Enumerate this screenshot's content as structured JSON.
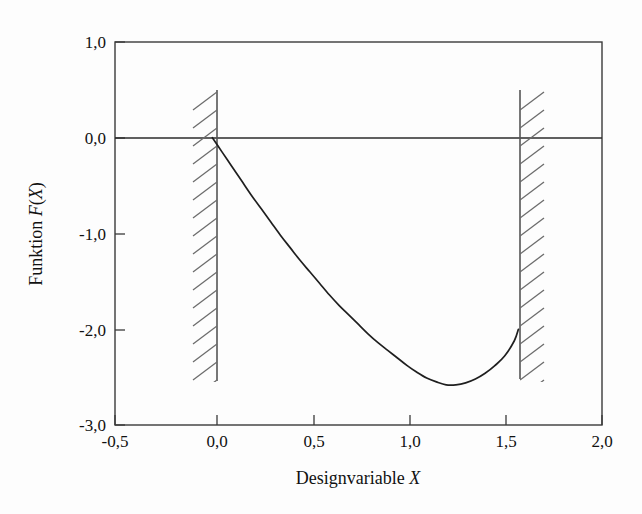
{
  "chart_data": {
    "type": "line",
    "title": "",
    "xlabel": "Designvariable X",
    "ylabel": "Funktion F(X)",
    "ylabel_prefix": "Funktion ",
    "ylabel_var": "F",
    "ylabel_suffix": "(",
    "ylabel_var2": "X",
    "ylabel_close": ")",
    "xlabel_prefix": "Designvariable ",
    "xlabel_var": "X",
    "xlim": [
      -0.5,
      2.0
    ],
    "ylim": [
      -3.0,
      1.0
    ],
    "grid": false,
    "legend": "none",
    "decimal_separator": ",",
    "x_ticks": [
      -0.5,
      0.0,
      0.5,
      1.0,
      1.5,
      2.0
    ],
    "x_tick_labels": [
      "-0,5",
      "0,0",
      "0,5",
      "1,0",
      "1,5",
      "2,0"
    ],
    "y_ticks": [
      1.0,
      0.0,
      -1.0,
      -2.0,
      -3.0
    ],
    "y_tick_labels": [
      "1,0",
      "0,0",
      "-1,0",
      "-2,0",
      "-3,0"
    ],
    "series": [
      {
        "name": "F(X)",
        "color": "#1f1f1f",
        "x": [
          0.0,
          0.05,
          0.1,
          0.15,
          0.2,
          0.25,
          0.3,
          0.35,
          0.4,
          0.45,
          0.5,
          0.55,
          0.6,
          0.65,
          0.7,
          0.75,
          0.8,
          0.85,
          0.9,
          0.95,
          1.0,
          1.05,
          1.1,
          1.15,
          1.2,
          1.25,
          1.3,
          1.35,
          1.4,
          1.45,
          1.5,
          1.55,
          1.5708
        ],
        "y": [
          0.0,
          -0.15,
          -0.3,
          -0.45,
          -0.6,
          -0.74,
          -0.88,
          -1.02,
          -1.15,
          -1.28,
          -1.4,
          -1.52,
          -1.64,
          -1.75,
          -1.85,
          -1.95,
          -2.05,
          -2.14,
          -2.22,
          -2.3,
          -2.38,
          -2.45,
          -2.51,
          -2.55,
          -2.58,
          -2.58,
          -2.56,
          -2.52,
          -2.46,
          -2.38,
          -2.28,
          -2.12,
          -2.0
        ]
      }
    ],
    "annotations": [
      {
        "type": "constraint-boundary",
        "name": "lower-bound",
        "x": 0.0,
        "hatch_side": "left",
        "y_top": 0.5,
        "y_bottom": -2.5
      },
      {
        "type": "constraint-boundary",
        "name": "upper-bound",
        "x": 1.5708,
        "hatch_side": "right",
        "y_top": 0.5,
        "y_bottom": -2.5
      },
      {
        "type": "reference-line",
        "name": "zero-line",
        "y": 0.0
      }
    ],
    "curve_minimum": {
      "x": 1.05,
      "y": -2.58
    },
    "curve_start": {
      "x": 0.0,
      "y": 0.0
    },
    "curve_end": {
      "x": 1.5708,
      "y": -2.0
    }
  },
  "figure": {
    "background_color": "#fdfdfd",
    "line_color": "#1f1f1f",
    "frame_color": "#3a3a3a",
    "hatch_color": "#6b6b6b"
  }
}
